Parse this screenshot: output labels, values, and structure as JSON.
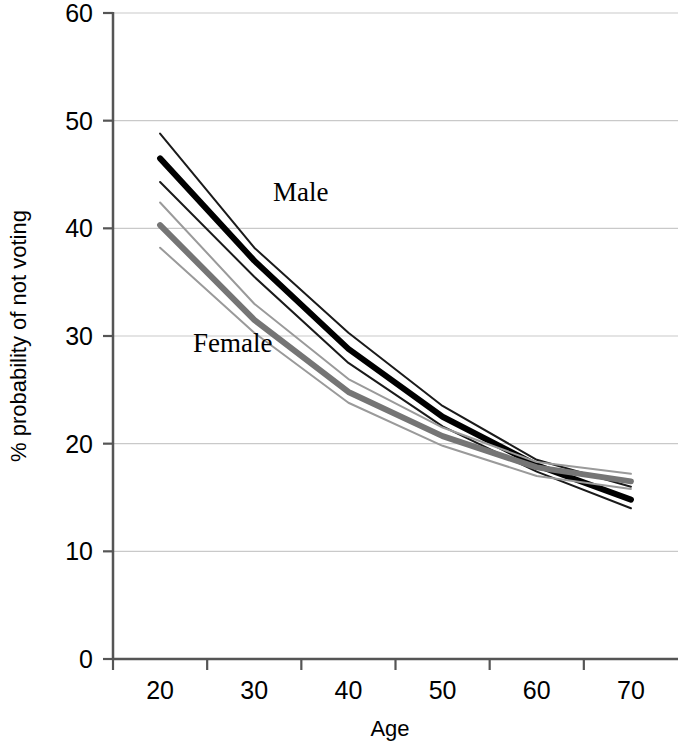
{
  "chart_data": {
    "type": "line",
    "title": "",
    "subtitle": "",
    "xlabel": "Age",
    "ylabel": "% probability of not voting",
    "x": [
      20,
      30,
      40,
      50,
      60,
      70
    ],
    "xlim": [
      15,
      75
    ],
    "ylim": [
      0,
      60
    ],
    "xticks": [
      20,
      30,
      40,
      50,
      60,
      70
    ],
    "yticks": [
      0,
      10,
      20,
      30,
      40,
      50,
      60
    ],
    "xtick_labels": [
      "20",
      "30",
      "40",
      "50",
      "60",
      "70"
    ],
    "ytick_labels": [
      "0",
      "10",
      "20",
      "30",
      "40",
      "50",
      "60"
    ],
    "grid": "horizontal",
    "legend": "inline-annotations",
    "annotations": [
      {
        "text": "Male",
        "x": 32,
        "y": 42.5,
        "color": "#000000"
      },
      {
        "text": "Female",
        "x": 23.5,
        "y": 28.5,
        "color": "#000000"
      }
    ],
    "series": [
      {
        "name": "Male upper confidence limit",
        "group": "Male",
        "role": "upper_ci",
        "color": "#1a1a1a",
        "width": 2,
        "values": [
          48.8,
          38.2,
          30.3,
          23.5,
          18.5,
          16.0
        ]
      },
      {
        "name": "Male estimate",
        "group": "Male",
        "role": "estimate",
        "color": "#000000",
        "width": 6,
        "values": [
          46.5,
          37.0,
          28.8,
          22.5,
          18.0,
          14.8
        ]
      },
      {
        "name": "Male lower confidence limit",
        "group": "Male",
        "role": "lower_ci",
        "color": "#1a1a1a",
        "width": 2,
        "values": [
          44.3,
          35.5,
          27.5,
          21.6,
          17.4,
          14.0
        ]
      },
      {
        "name": "Female upper confidence limit",
        "group": "Female",
        "role": "upper_ci",
        "color": "#9a9a9a",
        "width": 2,
        "values": [
          42.4,
          33.0,
          26.0,
          21.5,
          18.3,
          17.2
        ]
      },
      {
        "name": "Female estimate",
        "group": "Female",
        "role": "estimate",
        "color": "#757575",
        "width": 6,
        "values": [
          40.3,
          31.5,
          24.8,
          20.7,
          17.8,
          16.5
        ]
      },
      {
        "name": "Female lower confidence limit",
        "group": "Female",
        "role": "lower_ci",
        "color": "#9a9a9a",
        "width": 2,
        "values": [
          38.2,
          30.3,
          23.8,
          19.8,
          17.0,
          15.8
        ]
      }
    ]
  },
  "axes": {
    "y_title": "% probability of not voting",
    "x_title": "Age"
  }
}
